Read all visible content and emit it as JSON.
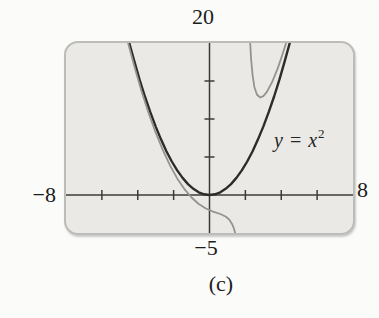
{
  "figure": {
    "caption": "(c)",
    "equation_label": {
      "lhs": "y",
      "relation": "=",
      "base": "x",
      "exponent": "2"
    },
    "axis_window_labels": {
      "top": "20",
      "left": "−8",
      "right": "8",
      "bottom": "−5"
    }
  },
  "chart_data": {
    "type": "line",
    "title": "",
    "xlabel": "",
    "ylabel": "",
    "viewing_rectangle": {
      "xmin": -8,
      "xmax": 8,
      "ymin": -5,
      "ymax": 20
    },
    "x_tick_step": 2,
    "y_tick_step": 5,
    "grid": false,
    "legend": "none (one curve labeled by in-plot annotation)",
    "axis_color": "#3b3b3b",
    "screen_background": "#eae9e6",
    "screen_border_color": "#bcbcba",
    "annotation": {
      "text": "y = x²",
      "position": "right of parabola, near (4, 8)"
    },
    "series": [
      {
        "name": "y = x²",
        "color": "#2e2c29",
        "stroke_width": 2.4,
        "points": [
          [
            -4.47,
            19.98
          ],
          [
            -4.2,
            17.64
          ],
          [
            -3.9,
            15.21
          ],
          [
            -3.6,
            12.96
          ],
          [
            -3.3,
            10.89
          ],
          [
            -3.0,
            9.0
          ],
          [
            -2.7,
            7.29
          ],
          [
            -2.4,
            5.76
          ],
          [
            -2.1,
            4.41
          ],
          [
            -1.8,
            3.24
          ],
          [
            -1.5,
            2.25
          ],
          [
            -1.2,
            1.44
          ],
          [
            -0.9,
            0.81
          ],
          [
            -0.6,
            0.36
          ],
          [
            -0.3,
            0.09
          ],
          [
            0,
            0
          ],
          [
            0.3,
            0.09
          ],
          [
            0.6,
            0.36
          ],
          [
            0.9,
            0.81
          ],
          [
            1.2,
            1.44
          ],
          [
            1.5,
            2.25
          ],
          [
            1.8,
            3.24
          ],
          [
            2.1,
            4.41
          ],
          [
            2.4,
            5.76
          ],
          [
            2.7,
            7.29
          ],
          [
            3.0,
            9.0
          ],
          [
            3.3,
            10.89
          ],
          [
            3.6,
            12.96
          ],
          [
            3.9,
            15.21
          ],
          [
            4.2,
            17.64
          ],
          [
            4.47,
            19.98
          ]
        ]
      },
      {
        "name": "unlabeled thin curve approaching y = x² (rational, vertical asymptote near x = 2)",
        "color": "#96938e",
        "stroke_width": 1.8,
        "vertical_asymptote_x": 2,
        "branches": [
          [
            [
              -4.54,
              20.0
            ],
            [
              -4.2,
              17.0
            ],
            [
              -3.8,
              13.75
            ],
            [
              -3.4,
              10.82
            ],
            [
              -3.0,
              8.2
            ],
            [
              -2.6,
              5.89
            ],
            [
              -2.2,
              3.89
            ],
            [
              -1.8,
              2.19
            ],
            [
              -1.4,
              0.78
            ],
            [
              -1.0,
              -0.33
            ],
            [
              -0.6,
              -1.18
            ],
            [
              -0.2,
              -1.78
            ],
            [
              0.2,
              -2.18
            ],
            [
              0.6,
              -2.5
            ],
            [
              0.9,
              -2.83
            ],
            [
              1.1,
              -3.23
            ],
            [
              1.25,
              -3.77
            ],
            [
              1.35,
              -4.33
            ],
            [
              1.43,
              -5.0
            ]
          ],
          [
            [
              2.27,
              20.0
            ],
            [
              2.32,
              17.88
            ],
            [
              2.4,
              15.76
            ],
            [
              2.5,
              14.25
            ],
            [
              2.65,
              13.18
            ],
            [
              2.83,
              12.83
            ],
            [
              3.0,
              13.0
            ],
            [
              3.2,
              13.57
            ],
            [
              3.5,
              14.92
            ],
            [
              3.8,
              16.66
            ],
            [
              4.05,
              18.35
            ],
            [
              4.27,
              20.0
            ]
          ]
        ]
      }
    ]
  }
}
